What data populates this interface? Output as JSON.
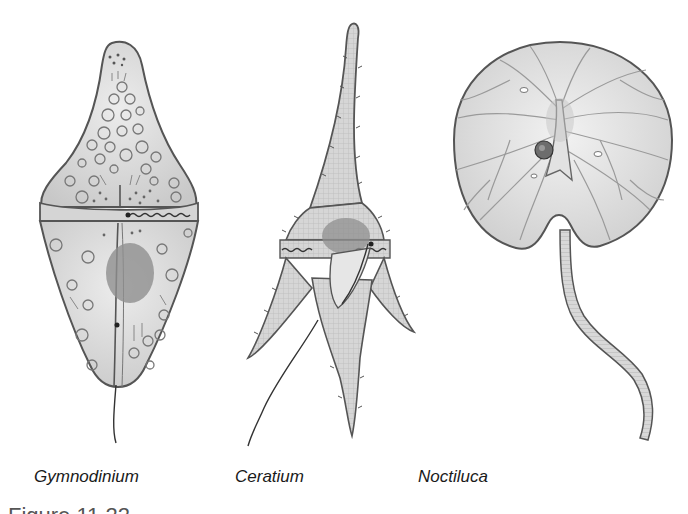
{
  "figure": {
    "caption_partial": "Figure 11.22",
    "colors": {
      "background": "#ffffff",
      "cell_fill": "#dcdcdc",
      "cell_stroke": "#555555",
      "nucleus": "#8f8f8f",
      "label_text": "#1a1a1a"
    },
    "panels": [
      {
        "id": "gymnodinium",
        "label": "Gymnodinium"
      },
      {
        "id": "ceratium",
        "label": "Ceratium"
      },
      {
        "id": "noctiluca",
        "label": "Noctiluca"
      }
    ]
  }
}
